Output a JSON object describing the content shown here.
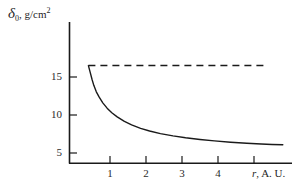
{
  "chart_data": {
    "type": "line",
    "title": "",
    "xlabel": "r, A. U.",
    "ylabel": "δ₀, g/cm²",
    "ylabel_parts": {
      "symbol": "δ",
      "subscript": "0",
      "separator": ", ",
      "units": "g/cm",
      "units_exponent": "2"
    },
    "xlabel_parts": {
      "symbol": "r",
      "rest": ", A. U."
    },
    "xlim": [
      0,
      6.0
    ],
    "ylim": [
      4.2,
      18.6
    ],
    "xticks": [
      1,
      2,
      3,
      4
    ],
    "xtick_labels": [
      "1",
      "2",
      "3",
      "4"
    ],
    "yticks": [
      5,
      10,
      15
    ],
    "ytick_labels": [
      "5",
      "10",
      "15"
    ],
    "grid": false,
    "legend": null,
    "series": [
      {
        "name": "asymptote-dashed",
        "style": "dashed",
        "color": "#1a1a1a",
        "x": [
          0.4,
          5.4
        ],
        "y": [
          16.5,
          16.5
        ]
      },
      {
        "name": "delta-0-curve",
        "style": "solid",
        "color": "#1a1a1a",
        "x": [
          0.4,
          0.45,
          0.5,
          0.55,
          0.62,
          0.7,
          0.8,
          0.92,
          1.05,
          1.2,
          1.4,
          1.6,
          1.85,
          2.1,
          2.4,
          2.75,
          3.1,
          3.5,
          3.9,
          4.35,
          4.8,
          5.2,
          5.5,
          5.8
        ],
        "y": [
          16.5,
          15.6,
          14.7,
          13.9,
          13.05,
          12.35,
          11.6,
          10.9,
          10.3,
          9.75,
          9.15,
          8.7,
          8.25,
          7.9,
          7.55,
          7.25,
          7.0,
          6.78,
          6.6,
          6.42,
          6.28,
          6.18,
          6.12,
          6.08
        ]
      }
    ],
    "annotations": []
  },
  "axes": {
    "y_axis_top_value": 18.6,
    "x_axis_right_value": 6.0,
    "axis_color": "#1a1a1a"
  }
}
